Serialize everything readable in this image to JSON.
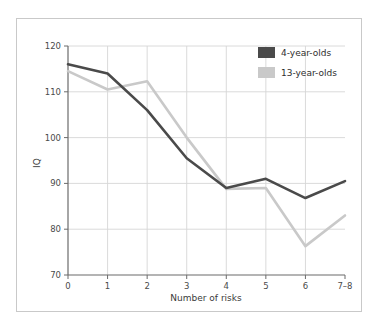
{
  "chart_data": {
    "type": "line",
    "title": "",
    "xlabel": "Number of risks",
    "ylabel": "IQ",
    "categories": [
      "0",
      "1",
      "2",
      "3",
      "4",
      "5",
      "6",
      "7–8"
    ],
    "x_tick_labels": [
      "0",
      "1",
      "2",
      "3",
      "4",
      "5",
      "6",
      "7–8"
    ],
    "y_tick_labels": [
      "70",
      "80",
      "90",
      "100",
      "110",
      "120"
    ],
    "y_ticks": [
      70,
      80,
      90,
      100,
      110,
      120
    ],
    "ylim": [
      70,
      120
    ],
    "grid": "horizontal-and-vertical",
    "legend_position": "top-right",
    "series": [
      {
        "name": "4-year-olds",
        "color": "#4a4a4a",
        "values": [
          116.0,
          114.0,
          106.0,
          95.5,
          89.0,
          91.0,
          86.8,
          90.5
        ]
      },
      {
        "name": "13-year-olds",
        "color": "#c9c9c9",
        "values": [
          114.5,
          110.5,
          112.3,
          100.0,
          88.8,
          89.0,
          76.3,
          83.0
        ]
      }
    ]
  },
  "legend": {
    "items": [
      {
        "label": "4-year-olds",
        "color": "#4a4a4a"
      },
      {
        "label": "13-year-olds",
        "color": "#c9c9c9"
      }
    ]
  },
  "axes": {
    "x_title": "Number of risks",
    "y_title": "IQ"
  },
  "colors": {
    "frame": "#c9c9c9",
    "grid": "#d6d6d6",
    "axis": "#6b6b6b",
    "background": "#ffffff",
    "series_dark": "#4a4a4a",
    "series_light": "#c9c9c9"
  }
}
